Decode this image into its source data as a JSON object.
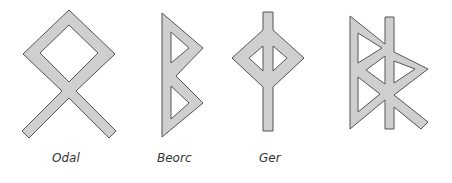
{
  "figure": {
    "runes": [
      {
        "id": "odal",
        "label": "Odal"
      },
      {
        "id": "beorc",
        "label": "Beorc"
      },
      {
        "id": "ger",
        "label": "Ger"
      },
      {
        "id": "bindrune",
        "label": ""
      }
    ]
  },
  "colors": {
    "fill": "#cfcfcf",
    "stroke": "#555555",
    "label": "#333333",
    "background": "#ffffff"
  }
}
